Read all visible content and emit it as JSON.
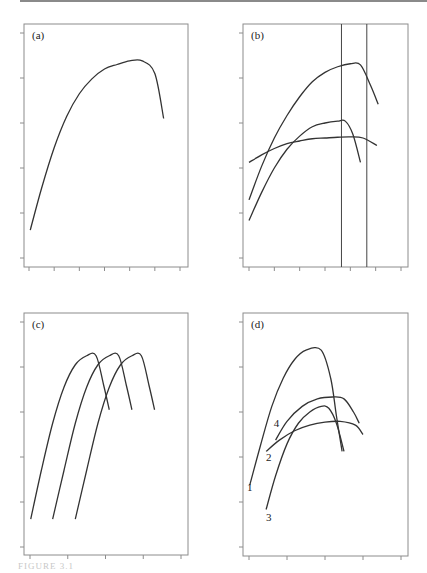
{
  "figure": {
    "caption": "FIGURE 3.1",
    "line_color": "#333333",
    "frame_color": "#8c8c8c"
  },
  "chart_data": [
    {
      "type": "line",
      "panel": "(a)",
      "title": "",
      "xlabel": "",
      "ylabel": "",
      "x_ticks": 7,
      "y_ticks": 6,
      "xlim": [
        0,
        6
      ],
      "ylim": [
        0,
        5
      ],
      "grid": false,
      "series": [
        {
          "name": "curve",
          "points": [
            [
              0.05,
              0.62
            ],
            [
              0.5,
              1.55
            ],
            [
              1,
              2.45
            ],
            [
              1.5,
              3.15
            ],
            [
              2,
              3.65
            ],
            [
              2.5,
              3.98
            ],
            [
              3,
              4.2
            ],
            [
              3.5,
              4.3
            ],
            [
              4,
              4.38
            ],
            [
              4.5,
              4.38
            ],
            [
              5,
              4.1
            ],
            [
              5.35,
              3.1
            ]
          ]
        }
      ],
      "annotations": []
    },
    {
      "type": "line",
      "panel": "(b)",
      "title": "",
      "xlabel": "",
      "ylabel": "",
      "x_ticks": 7,
      "y_ticks": 6,
      "xlim": [
        0,
        6
      ],
      "ylim": [
        0,
        6
      ],
      "grid": false,
      "series": [
        {
          "name": "upper",
          "points": [
            [
              0,
              1.55
            ],
            [
              0.5,
              2.45
            ],
            [
              1,
              3.2
            ],
            [
              1.5,
              3.8
            ],
            [
              2,
              4.3
            ],
            [
              2.5,
              4.7
            ],
            [
              3,
              4.95
            ],
            [
              3.5,
              5.1
            ],
            [
              4,
              5.18
            ],
            [
              4.4,
              5.15
            ],
            [
              4.8,
              4.6
            ],
            [
              5.1,
              4.1
            ]
          ]
        },
        {
          "name": "middle",
          "points": [
            [
              0,
              1
            ],
            [
              0.5,
              1.75
            ],
            [
              1,
              2.4
            ],
            [
              1.5,
              2.9
            ],
            [
              2,
              3.25
            ],
            [
              2.5,
              3.5
            ],
            [
              3,
              3.6
            ],
            [
              3.5,
              3.65
            ],
            [
              3.8,
              3.65
            ],
            [
              4.1,
              3.3
            ],
            [
              4.4,
              2.55
            ]
          ]
        },
        {
          "name": "flat",
          "points": [
            [
              0,
              2.55
            ],
            [
              0.5,
              2.75
            ],
            [
              1,
              2.92
            ],
            [
              1.5,
              3.05
            ],
            [
              2,
              3.12
            ],
            [
              2.5,
              3.18
            ],
            [
              3,
              3.2
            ],
            [
              3.5,
              3.22
            ],
            [
              4,
              3.23
            ],
            [
              4.5,
              3.2
            ],
            [
              5.05,
              3.0
            ]
          ]
        }
      ],
      "vertical_lines_x": [
        3.65,
        4.65
      ],
      "annotations": []
    },
    {
      "type": "line",
      "panel": "(c)",
      "title": "",
      "xlabel": "",
      "ylabel": "",
      "x_ticks": 5,
      "y_ticks": 6,
      "xlim": [
        0,
        4
      ],
      "ylim": [
        0,
        5
      ],
      "grid": false,
      "series": [
        {
          "name": "curve 1",
          "points": [
            [
              0.02,
              0.62
            ],
            [
              0.3,
              1.7
            ],
            [
              0.6,
              2.75
            ],
            [
              0.9,
              3.55
            ],
            [
              1.2,
              4.05
            ],
            [
              1.5,
              4.25
            ],
            [
              1.75,
              4.25
            ],
            [
              1.95,
              3.6
            ],
            [
              2.1,
              3.05
            ]
          ]
        },
        {
          "name": "curve 2",
          "points": [
            [
              0.6,
              0.62
            ],
            [
              0.9,
              1.7
            ],
            [
              1.2,
              2.75
            ],
            [
              1.5,
              3.55
            ],
            [
              1.8,
              4.05
            ],
            [
              2.1,
              4.25
            ],
            [
              2.35,
              4.25
            ],
            [
              2.55,
              3.6
            ],
            [
              2.7,
              3.05
            ]
          ]
        },
        {
          "name": "curve 3",
          "points": [
            [
              1.2,
              0.62
            ],
            [
              1.5,
              1.7
            ],
            [
              1.8,
              2.75
            ],
            [
              2.1,
              3.55
            ],
            [
              2.4,
              4.05
            ],
            [
              2.7,
              4.25
            ],
            [
              2.95,
              4.25
            ],
            [
              3.15,
              3.6
            ],
            [
              3.3,
              3.05
            ]
          ]
        }
      ],
      "annotations": []
    },
    {
      "type": "line",
      "panel": "(d)",
      "title": "",
      "xlabel": "",
      "ylabel": "",
      "x_ticks": 5,
      "y_ticks": 6,
      "xlim": [
        0,
        4
      ],
      "ylim": [
        0,
        6
      ],
      "grid": false,
      "series": [
        {
          "name": "1",
          "points": [
            [
              0.02,
              1.65
            ],
            [
              0.3,
              2.7
            ],
            [
              0.6,
              3.75
            ],
            [
              0.9,
              4.5
            ],
            [
              1.2,
              5.0
            ],
            [
              1.5,
              5.25
            ],
            [
              1.9,
              5.25
            ],
            [
              2.15,
              4.5
            ],
            [
              2.3,
              3.5
            ],
            [
              2.45,
              2.55
            ]
          ]
        },
        {
          "name": "2",
          "points": [
            [
              0.45,
              2.55
            ],
            [
              0.8,
              2.85
            ],
            [
              1.2,
              3.1
            ],
            [
              1.6,
              3.25
            ],
            [
              2.0,
              3.33
            ],
            [
              2.4,
              3.35
            ],
            [
              2.8,
              3.25
            ],
            [
              3.0,
              3.0
            ]
          ]
        },
        {
          "name": "3",
          "points": [
            [
              0.45,
              1.0
            ],
            [
              0.7,
              1.9
            ],
            [
              1.0,
              2.75
            ],
            [
              1.3,
              3.3
            ],
            [
              1.6,
              3.6
            ],
            [
              1.9,
              3.75
            ],
            [
              2.1,
              3.7
            ],
            [
              2.3,
              3.3
            ],
            [
              2.5,
              2.55
            ]
          ]
        },
        {
          "name": "4",
          "points": [
            [
              0.7,
              2.85
            ],
            [
              1.0,
              3.35
            ],
            [
              1.4,
              3.75
            ],
            [
              1.8,
              3.95
            ],
            [
              2.2,
              4.0
            ],
            [
              2.5,
              3.95
            ],
            [
              2.75,
              3.6
            ],
            [
              2.9,
              3.3
            ]
          ]
        }
      ],
      "annotations": [
        {
          "text": "1",
          "x": -0.05,
          "y": 1.5
        },
        {
          "text": "2",
          "x": 0.45,
          "y": 2.3
        },
        {
          "text": "3",
          "x": 0.45,
          "y": 0.7
        },
        {
          "text": "4",
          "x": 0.65,
          "y": 3.2
        }
      ]
    }
  ]
}
